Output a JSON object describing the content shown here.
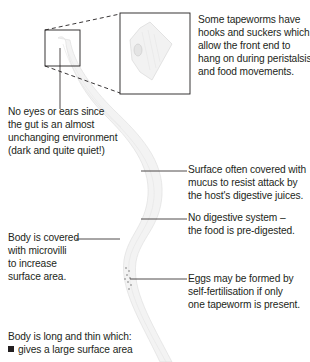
{
  "diagram": {
    "colors": {
      "text": "#231f20",
      "lines": "#231f20",
      "body_fill": "#f2f2f2",
      "body_stroke": "#d9d9d9"
    },
    "annotations": {
      "hooks": {
        "lines": [
          "Some tapeworms have",
          "hooks and suckers which",
          "allow the front end to",
          "hang on during peristalsis",
          "and food movements."
        ]
      },
      "eyes": {
        "lines": [
          "No eyes or ears since",
          "the gut is an almost",
          "unchanging environment",
          "(dark and quite quiet!)"
        ]
      },
      "mucus": {
        "lines": [
          "Surface often covered with",
          "mucus to resist attack by",
          "the host's digestive juices."
        ]
      },
      "digestive": {
        "lines": [
          "No digestive system –",
          "the food is pre-digested."
        ]
      },
      "microvilli": {
        "lines": [
          "Body is covered",
          "with microvilli",
          "to increase",
          "surface area."
        ]
      },
      "eggs": {
        "lines": [
          "Eggs may be formed by",
          "self-fertilisation if only",
          "one tapeworm is present."
        ]
      },
      "long_thin": {
        "heading": "Body is long and thin which:",
        "bullets": [
          "gives a large surface area"
        ]
      }
    },
    "icons": {
      "magnified_view": "head-magnification-inset",
      "body": "tapeworm-body-illustration"
    }
  }
}
